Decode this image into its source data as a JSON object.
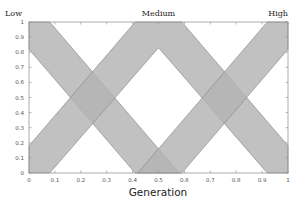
{
  "chart_data": {
    "type": "area",
    "title": "",
    "xlabel": "Generation",
    "ylabel": "",
    "xlim": [
      0,
      1
    ],
    "ylim": [
      0,
      1
    ],
    "grid": false,
    "legend": "none",
    "x_ticks": [
      "0",
      "0.1",
      "0.2",
      "0.3",
      "0.4",
      "0.5",
      "0.6",
      "0.7",
      "0.8",
      "0.9",
      "1"
    ],
    "y_ticks": [
      "0",
      "0.1",
      "0.2",
      "0.3",
      "0.4",
      "0.5",
      "0.6",
      "0.7",
      "0.8",
      "0.9",
      "1"
    ],
    "annotations": [
      {
        "text": "Low",
        "x": 0.0,
        "y": 1.05
      },
      {
        "text": "Medium",
        "x": 0.5,
        "y": 1.05
      },
      {
        "text": "High",
        "x": 1.0,
        "y": 1.05
      }
    ],
    "series": [
      {
        "name": "Low",
        "description": "Descending fuzzy band",
        "polygon": [
          [
            0,
            1
          ],
          [
            0.08,
            1
          ],
          [
            0.58,
            0
          ],
          [
            0.41,
            0
          ],
          [
            0,
            0.82
          ]
        ]
      },
      {
        "name": "Medium",
        "description": "Triangular fuzzy band (rises then falls)",
        "polygon": [
          [
            0,
            0.18
          ],
          [
            0.41,
            1
          ],
          [
            0.59,
            1
          ],
          [
            1,
            0.18
          ],
          [
            1,
            0
          ],
          [
            0.92,
            0
          ],
          [
            0.5,
            0.83
          ],
          [
            0.08,
            0
          ],
          [
            0,
            0
          ]
        ]
      },
      {
        "name": "High",
        "description": "Ascending fuzzy band",
        "polygon": [
          [
            0.42,
            0
          ],
          [
            0.59,
            0
          ],
          [
            1,
            0.82
          ],
          [
            1,
            1
          ],
          [
            0.92,
            1
          ]
        ]
      }
    ],
    "crossings": [
      {
        "x": 0.25,
        "y": 0.66
      },
      {
        "x": 0.2,
        "y": 0.5
      },
      {
        "x": 0.25,
        "y": 0.33
      },
      {
        "x": 0.5,
        "y": 0.0
      },
      {
        "x": 0.75,
        "y": 0.66
      },
      {
        "x": 0.8,
        "y": 0.5
      },
      {
        "x": 0.75,
        "y": 0.33
      }
    ],
    "colors": {
      "band_fill": "#b3b3b3",
      "band_edge": "#8c8c8c",
      "axis": "#9a9a9a"
    }
  }
}
